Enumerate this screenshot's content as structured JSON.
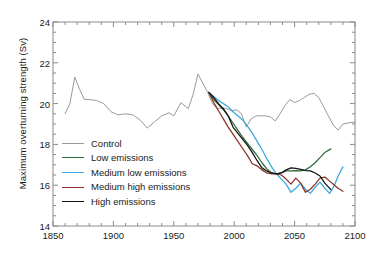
{
  "chart_data": {
    "type": "line",
    "title": "",
    "xlabel": "",
    "ylabel": "Maximum overturning strength (Sv)",
    "xlim": [
      1850,
      2100
    ],
    "ylim": [
      14,
      24
    ],
    "xticks": [
      1850,
      1900,
      1950,
      2000,
      2050,
      2100
    ],
    "yticks": [
      14,
      16,
      18,
      20,
      22,
      24
    ],
    "xminor_step": 10,
    "yminor_step": 0.5,
    "grid": false,
    "legend_position": "center-left",
    "series": [
      {
        "name": "Control",
        "color": "#9a9a9a",
        "x": [
          1860,
          1864,
          1868,
          1872,
          1876,
          1880,
          1886,
          1892,
          1898,
          1904,
          1910,
          1916,
          1922,
          1928,
          1934,
          1940,
          1946,
          1950,
          1956,
          1962,
          1966,
          1970,
          1974,
          1978,
          1982,
          1986,
          1990,
          1994,
          1998,
          2002,
          2006,
          2010,
          2014,
          2018,
          2022,
          2026,
          2030,
          2034,
          2038,
          2042,
          2046,
          2050,
          2054,
          2058,
          2062,
          2066,
          2070,
          2074,
          2078,
          2082,
          2086,
          2090,
          2094,
          2100
        ],
        "y": [
          19.5,
          20.0,
          21.3,
          20.7,
          20.2,
          20.2,
          20.15,
          20.0,
          19.6,
          19.45,
          19.5,
          19.45,
          19.2,
          18.8,
          19.1,
          19.4,
          19.55,
          19.4,
          20.05,
          19.75,
          20.45,
          21.45,
          21.0,
          20.55,
          20.0,
          19.75,
          19.8,
          19.75,
          19.65,
          19.7,
          19.5,
          18.85,
          19.25,
          19.4,
          19.4,
          19.4,
          19.35,
          19.15,
          19.5,
          19.9,
          20.2,
          20.05,
          20.15,
          20.3,
          20.45,
          20.5,
          20.3,
          19.85,
          19.4,
          18.95,
          18.7,
          19.0,
          19.05,
          19.1
        ]
      },
      {
        "name": "Low emissions",
        "color": "#2f6b3a",
        "x": [
          1979,
          1983,
          1987,
          1991,
          1995,
          1999,
          2003,
          2007,
          2011,
          2015,
          2019,
          2023,
          2027,
          2031,
          2035,
          2039,
          2043,
          2047,
          2051,
          2055,
          2059,
          2063,
          2067,
          2071,
          2075,
          2080
        ],
        "y": [
          20.55,
          20.2,
          19.95,
          19.7,
          19.4,
          19.05,
          18.7,
          18.35,
          18.05,
          17.75,
          17.45,
          17.1,
          16.8,
          16.6,
          16.55,
          16.6,
          16.7,
          16.7,
          16.72,
          16.7,
          16.75,
          16.9,
          17.1,
          17.35,
          17.6,
          17.78
        ]
      },
      {
        "name": "Medium low emissions",
        "color": "#3aa8dc",
        "x": [
          1979,
          1983,
          1987,
          1991,
          1995,
          1999,
          2003,
          2007,
          2011,
          2015,
          2019,
          2023,
          2027,
          2031,
          2035,
          2039,
          2043,
          2047,
          2051,
          2055,
          2059,
          2063,
          2067,
          2071,
          2075,
          2079,
          2083,
          2086,
          2090
        ],
        "y": [
          20.55,
          20.35,
          20.15,
          20.0,
          19.85,
          19.6,
          19.4,
          19.2,
          18.9,
          18.55,
          18.15,
          17.75,
          17.3,
          16.9,
          16.55,
          16.3,
          16.05,
          15.65,
          15.85,
          16.1,
          15.8,
          15.6,
          15.9,
          16.15,
          15.85,
          15.6,
          16.0,
          16.45,
          16.9
        ]
      },
      {
        "name": "Medium high emissions",
        "color": "#8c3224",
        "x": [
          1979,
          1983,
          1987,
          1991,
          1995,
          1999,
          2003,
          2007,
          2011,
          2015,
          2019,
          2023,
          2027,
          2031,
          2035,
          2039,
          2043,
          2047,
          2051,
          2055,
          2059,
          2063,
          2067,
          2071,
          2075,
          2079,
          2083,
          2086,
          2090
        ],
        "y": [
          20.55,
          20.05,
          19.65,
          19.25,
          18.85,
          18.5,
          18.15,
          17.8,
          17.45,
          17.05,
          16.95,
          16.75,
          16.6,
          16.55,
          16.55,
          16.5,
          16.3,
          16.05,
          16.35,
          16.1,
          15.65,
          15.8,
          16.05,
          16.35,
          16.4,
          16.2,
          16.0,
          15.85,
          15.7
        ]
      },
      {
        "name": "High emissions",
        "color": "#111111",
        "x": [
          1979,
          1983,
          1987,
          1991,
          1995,
          1999,
          2003,
          2007,
          2011,
          2015,
          2019,
          2023,
          2027,
          2031,
          2035,
          2039,
          2043,
          2047,
          2051,
          2055,
          2059,
          2063,
          2067,
          2071,
          2075,
          2080
        ],
        "y": [
          20.55,
          20.3,
          20.0,
          19.75,
          19.4,
          18.85,
          18.55,
          18.25,
          17.95,
          17.6,
          17.2,
          16.85,
          16.7,
          16.6,
          16.55,
          16.6,
          16.75,
          16.85,
          16.82,
          16.78,
          16.72,
          16.7,
          16.6,
          16.45,
          16.1,
          15.78
        ]
      }
    ]
  },
  "axes": {
    "ylabel": "Maximum overturning strength (Sv)",
    "yticklabels": [
      "24",
      "22",
      "20",
      "18",
      "16",
      "14"
    ],
    "xticklabels": [
      "1850",
      "1900",
      "1950",
      "2000",
      "2050",
      "2100"
    ]
  },
  "legend": {
    "items": [
      {
        "label": "Control",
        "color": "#9a9a9a"
      },
      {
        "label": "Low emissions",
        "color": "#2f6b3a"
      },
      {
        "label": "Medium low emissions",
        "color": "#3aa8dc"
      },
      {
        "label": "Medium high emissions",
        "color": "#8c3224"
      },
      {
        "label": "High emissions",
        "color": "#111111"
      }
    ]
  }
}
